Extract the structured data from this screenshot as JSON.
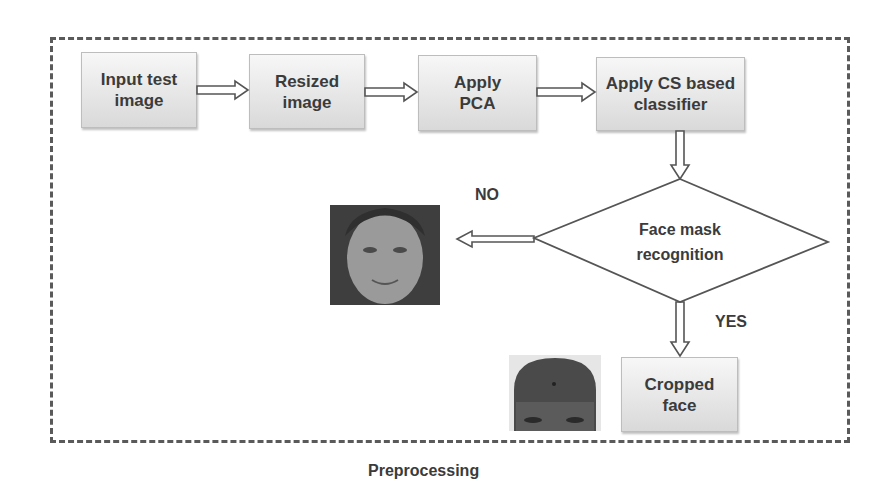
{
  "diagram": {
    "title": "Preprocessing",
    "nodes": [
      {
        "id": "input",
        "label_line1": "Input test",
        "label_line2": "image",
        "shape": "rectangle"
      },
      {
        "id": "resize",
        "label_line1": "Resized",
        "label_line2": "image",
        "shape": "rectangle"
      },
      {
        "id": "pca",
        "label_line1": "Apply",
        "label_line2": "PCA",
        "shape": "rectangle"
      },
      {
        "id": "classifier",
        "label_line1": "Apply CS based",
        "label_line2": "classifier",
        "shape": "rectangle"
      },
      {
        "id": "decision",
        "label_line1": "Face mask",
        "label_line2": "recognition",
        "shape": "diamond"
      },
      {
        "id": "cropped",
        "label_line1": "Cropped",
        "label_line2": "face",
        "shape": "rectangle"
      }
    ],
    "edges": [
      {
        "from": "input",
        "to": "resize"
      },
      {
        "from": "resize",
        "to": "pca"
      },
      {
        "from": "pca",
        "to": "classifier"
      },
      {
        "from": "classifier",
        "to": "decision"
      },
      {
        "from": "decision",
        "to": "face-image-full",
        "label": "NO"
      },
      {
        "from": "decision",
        "to": "cropped",
        "label": "YES"
      }
    ],
    "branch_labels": {
      "no": "NO",
      "yes": "YES"
    },
    "images": [
      {
        "id": "face-image-full",
        "description": "full face photograph (grayscale)"
      },
      {
        "id": "face-image-cropped",
        "description": "cropped face (forehead/eyes) photograph"
      }
    ],
    "colors": {
      "border": "#5a5a5a",
      "box_top": "#f7f7f7",
      "box_bottom": "#d9d9d9",
      "text": "#3b3b3b"
    }
  }
}
